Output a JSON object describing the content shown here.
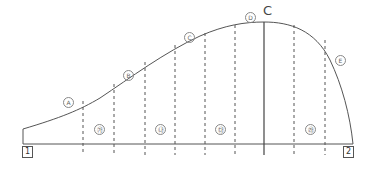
{
  "diagram": {
    "type": "curved profile with vertical divisions",
    "curve_labels": [
      "A",
      "B",
      "C",
      "D",
      "E"
    ],
    "section_labels": [
      "㉮",
      "㉯",
      "㉰",
      "㉱"
    ],
    "peak_label": "C",
    "endpoints": [
      "1",
      "2"
    ],
    "colors": {
      "line": "#555555",
      "dash": "#555555",
      "text": "#555555"
    }
  }
}
